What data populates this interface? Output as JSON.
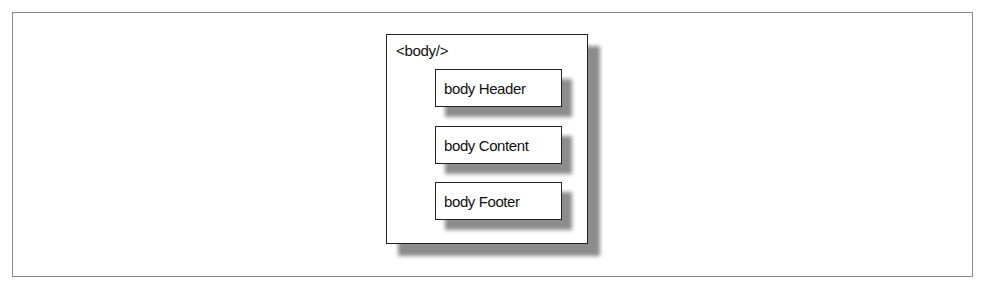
{
  "diagram": {
    "container": {
      "label": "<body/>"
    },
    "children": [
      {
        "label": "body Header"
      },
      {
        "label": "body Content"
      },
      {
        "label": "body Footer"
      }
    ]
  }
}
